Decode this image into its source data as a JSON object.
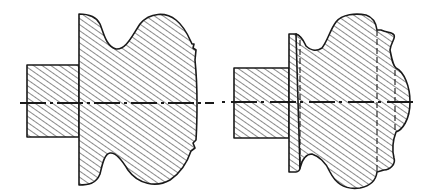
{
  "diagram": {
    "type": "engineering-cross-section",
    "colors": {
      "line": "#1a1a1a",
      "background": "#ffffff",
      "hatch": "#2a2a2a"
    },
    "figures": [
      {
        "id": "left",
        "description": "Hatched section of a knob-shaped turned part with cylindrical shank, before machining",
        "parts": [
          "shank",
          "body-with-waisted-profile"
        ],
        "centerline": "dash-dot axis"
      },
      {
        "id": "right",
        "description": "Hatched section of the same part with flange, hidden-line boundaries and domed end",
        "parts": [
          "shank",
          "flange",
          "body",
          "domed-end"
        ],
        "centerline": "dash-dot axis"
      }
    ]
  }
}
